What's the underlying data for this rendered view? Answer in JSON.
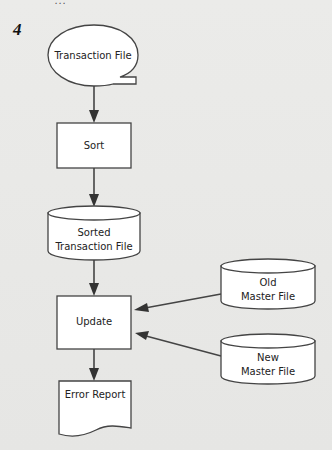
{
  "figure": {
    "number": "4",
    "cutoff_text": "..."
  },
  "diagram": {
    "nodes": [
      {
        "id": "transaction_file",
        "shape": "online-storage",
        "lines": [
          "Transaction File"
        ]
      },
      {
        "id": "sort",
        "shape": "process",
        "lines": [
          "Sort"
        ]
      },
      {
        "id": "sorted_transaction_file",
        "shape": "cylinder",
        "lines": [
          "Sorted",
          "Transaction File"
        ]
      },
      {
        "id": "update",
        "shape": "process",
        "lines": [
          "Update"
        ]
      },
      {
        "id": "old_master_file",
        "shape": "cylinder",
        "lines": [
          "Old",
          "Master File"
        ]
      },
      {
        "id": "new_master_file",
        "shape": "cylinder",
        "lines": [
          "New",
          "Master File"
        ]
      },
      {
        "id": "error_report",
        "shape": "document",
        "lines": [
          "Error Report"
        ]
      }
    ],
    "edges": [
      {
        "from": "transaction_file",
        "to": "sort"
      },
      {
        "from": "sort",
        "to": "sorted_transaction_file"
      },
      {
        "from": "sorted_transaction_file",
        "to": "update"
      },
      {
        "from": "old_master_file",
        "to": "update"
      },
      {
        "from": "new_master_file",
        "to": "update"
      },
      {
        "from": "update",
        "to": "error_report"
      }
    ]
  },
  "colors": {
    "background": "#e9e9e7",
    "shape_fill": "#ffffff",
    "stroke": "#444444"
  }
}
